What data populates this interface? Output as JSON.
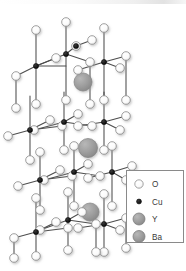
{
  "figure": {
    "background_color": "#ffffff"
  },
  "legend": {
    "border_color": "#8a8a8a",
    "background_color": "#ffffff",
    "items": [
      {
        "label": "O",
        "symbol": "open-circle",
        "fill": "#ffffff",
        "stroke": "#8f8f8f",
        "radius": 4.2
      },
      {
        "label": "Cu",
        "symbol": "filled-dot",
        "fill": "#1a1a1a",
        "stroke": "#1a1a1a",
        "radius": 2.4
      },
      {
        "label": "Y",
        "symbol": "gray-sphere",
        "fill": "#9a9a9a",
        "stroke": "#7d7d7d",
        "radius": 6.0
      },
      {
        "label": "Ba",
        "symbol": "gray-sphere",
        "fill": "#9a9a9a",
        "stroke": "#7d7d7d",
        "radius": 6.0
      }
    ]
  },
  "structure": {
    "compound": "YBa2Cu3O7",
    "bond_color": "#4d4d4d",
    "oxygen": {
      "fill": "#fdfdfd",
      "stroke": "#909090",
      "radius": 4.3
    },
    "copper": {
      "fill": "#151515",
      "stroke": "#000000",
      "radius": 2.6
    },
    "yttrium": {
      "fill": "#9b9b9b",
      "stroke": "#828282",
      "radius": 8.5
    },
    "barium": {
      "fill": "#a0a0a0",
      "stroke": "#858585",
      "radius": 8.0
    },
    "layer_labels": [
      "CuO chain layer",
      "BaO layer",
      "CuO2 plane",
      "Y layer",
      "CuO2 plane",
      "BaO layer",
      "CuO chain layer"
    ],
    "bonds": [
      [
        36,
        66,
        36,
        30
      ],
      [
        36,
        66,
        66,
        66
      ],
      [
        36,
        66,
        16,
        76
      ],
      [
        36,
        66,
        56,
        58
      ],
      [
        66,
        54,
        66,
        22
      ],
      [
        66,
        54,
        36,
        66
      ],
      [
        66,
        54,
        90,
        62
      ],
      [
        66,
        54,
        76,
        46
      ],
      [
        104,
        62,
        104,
        28
      ],
      [
        104,
        62,
        78,
        70
      ],
      [
        104,
        62,
        126,
        56
      ],
      [
        104,
        62,
        120,
        68
      ],
      [
        76,
        46,
        92,
        40
      ],
      [
        36,
        66,
        36,
        104
      ],
      [
        66,
        54,
        66,
        100
      ],
      [
        104,
        62,
        104,
        100
      ],
      [
        16,
        76,
        16,
        108
      ],
      [
        90,
        62,
        90,
        104
      ],
      [
        126,
        56,
        126,
        100
      ],
      [
        30,
        130,
        30,
        96
      ],
      [
        30,
        130,
        62,
        126
      ],
      [
        30,
        130,
        8,
        136
      ],
      [
        30,
        130,
        50,
        120
      ],
      [
        64,
        122,
        64,
        92
      ],
      [
        64,
        122,
        34,
        130
      ],
      [
        64,
        122,
        92,
        126
      ],
      [
        64,
        122,
        78,
        114
      ],
      [
        104,
        122,
        104,
        92
      ],
      [
        104,
        122,
        78,
        126
      ],
      [
        104,
        122,
        126,
        116
      ],
      [
        104,
        122,
        120,
        130
      ],
      [
        30,
        130,
        30,
        160
      ],
      [
        64,
        122,
        64,
        150
      ],
      [
        104,
        122,
        104,
        150
      ],
      [
        40,
        180,
        40,
        210
      ],
      [
        40,
        180,
        72,
        176
      ],
      [
        40,
        180,
        18,
        186
      ],
      [
        40,
        180,
        60,
        170
      ],
      [
        74,
        172,
        74,
        206
      ],
      [
        74,
        172,
        44,
        180
      ],
      [
        74,
        172,
        100,
        176
      ],
      [
        74,
        172,
        88,
        164
      ],
      [
        112,
        172,
        112,
        206
      ],
      [
        112,
        172,
        88,
        178
      ],
      [
        112,
        172,
        132,
        166
      ],
      [
        112,
        172,
        126,
        180
      ],
      [
        40,
        180,
        40,
        152
      ],
      [
        74,
        172,
        74,
        146
      ],
      [
        112,
        172,
        112,
        146
      ],
      [
        36,
        232,
        36,
        198
      ],
      [
        36,
        232,
        68,
        228
      ],
      [
        36,
        232,
        14,
        238
      ],
      [
        36,
        232,
        56,
        222
      ],
      [
        68,
        220,
        68,
        192
      ],
      [
        68,
        220,
        40,
        230
      ],
      [
        68,
        220,
        96,
        224
      ],
      [
        68,
        220,
        82,
        212
      ],
      [
        104,
        224,
        104,
        194
      ],
      [
        104,
        224,
        78,
        228
      ],
      [
        104,
        224,
        126,
        218
      ],
      [
        104,
        224,
        120,
        230
      ],
      [
        36,
        232,
        36,
        256
      ],
      [
        68,
        220,
        68,
        250
      ],
      [
        104,
        224,
        104,
        252
      ],
      [
        14,
        238,
        14,
        258
      ],
      [
        126,
        218,
        126,
        248
      ],
      [
        96,
        224,
        96,
        252
      ]
    ],
    "oxygen_atoms": [
      [
        36,
        30
      ],
      [
        66,
        22
      ],
      [
        104,
        28
      ],
      [
        16,
        76
      ],
      [
        56,
        58
      ],
      [
        90,
        62
      ],
      [
        76,
        46
      ],
      [
        126,
        56
      ],
      [
        120,
        68
      ],
      [
        92,
        40
      ],
      [
        78,
        70
      ],
      [
        36,
        104
      ],
      [
        66,
        100
      ],
      [
        104,
        100
      ],
      [
        16,
        108
      ],
      [
        90,
        104
      ],
      [
        126,
        100
      ],
      [
        8,
        136
      ],
      [
        50,
        120
      ],
      [
        92,
        126
      ],
      [
        78,
        114
      ],
      [
        126,
        116
      ],
      [
        120,
        130
      ],
      [
        62,
        126
      ],
      [
        34,
        130
      ],
      [
        78,
        126
      ],
      [
        30,
        160
      ],
      [
        64,
        150
      ],
      [
        104,
        150
      ],
      [
        18,
        186
      ],
      [
        60,
        170
      ],
      [
        100,
        176
      ],
      [
        88,
        164
      ],
      [
        132,
        166
      ],
      [
        126,
        180
      ],
      [
        72,
        176
      ],
      [
        44,
        180
      ],
      [
        88,
        178
      ],
      [
        40,
        152
      ],
      [
        74,
        146
      ],
      [
        112,
        146
      ],
      [
        40,
        210
      ],
      [
        74,
        206
      ],
      [
        112,
        206
      ],
      [
        36,
        198
      ],
      [
        68,
        192
      ],
      [
        104,
        194
      ],
      [
        14,
        238
      ],
      [
        56,
        222
      ],
      [
        96,
        224
      ],
      [
        82,
        212
      ],
      [
        126,
        218
      ],
      [
        120,
        230
      ],
      [
        68,
        228
      ],
      [
        40,
        230
      ],
      [
        78,
        228
      ],
      [
        36,
        256
      ],
      [
        68,
        250
      ],
      [
        104,
        252
      ],
      [
        14,
        258
      ],
      [
        126,
        248
      ],
      [
        96,
        252
      ]
    ],
    "copper_atoms": [
      [
        36,
        66
      ],
      [
        66,
        54
      ],
      [
        104,
        62
      ],
      [
        76,
        46
      ],
      [
        30,
        130
      ],
      [
        64,
        122
      ],
      [
        104,
        122
      ],
      [
        40,
        180
      ],
      [
        74,
        172
      ],
      [
        112,
        172
      ],
      [
        36,
        232
      ],
      [
        68,
        220
      ],
      [
        104,
        224
      ]
    ],
    "large_spheres": [
      {
        "element": "Ba",
        "x": 83,
        "y": 82,
        "r": 9.0
      },
      {
        "element": "Y",
        "x": 88,
        "y": 148,
        "r": 9.5
      },
      {
        "element": "Ba",
        "x": 90,
        "y": 212,
        "r": 9.0
      }
    ]
  }
}
